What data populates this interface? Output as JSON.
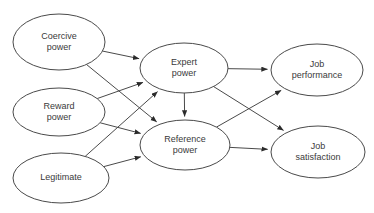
{
  "diagram": {
    "background_color": "#ffffff",
    "stroke_color": "#4a4a4a",
    "text_color": "#3a3a3a",
    "nodes": [
      {
        "id": "coercive",
        "lines": [
          "Coercive",
          "power"
        ],
        "cx": 59,
        "cy": 42,
        "rx": 46,
        "ry": 28
      },
      {
        "id": "reward",
        "lines": [
          "Reward",
          "power"
        ],
        "cx": 59,
        "cy": 112,
        "rx": 46,
        "ry": 24
      },
      {
        "id": "legitimate",
        "lines": [
          "Legitimate"
        ],
        "cx": 61,
        "cy": 178,
        "rx": 48,
        "ry": 25
      },
      {
        "id": "expert",
        "lines": [
          "Expert",
          "power"
        ],
        "cx": 184,
        "cy": 68,
        "rx": 44,
        "ry": 25
      },
      {
        "id": "reference",
        "lines": [
          "Reference",
          "power"
        ],
        "cx": 185,
        "cy": 145,
        "rx": 45,
        "ry": 25
      },
      {
        "id": "job_performance",
        "lines": [
          "Job",
          "performance"
        ],
        "cx": 317,
        "cy": 70,
        "rx": 46,
        "ry": 26
      },
      {
        "id": "job_satisfaction",
        "lines": [
          "Job",
          "satisfaction"
        ],
        "cx": 318,
        "cy": 152,
        "rx": 47,
        "ry": 26
      }
    ],
    "edges": [
      {
        "from": "coercive",
        "to": "expert",
        "label": ""
      },
      {
        "from": "coercive",
        "to": "reference",
        "label": ""
      },
      {
        "from": "reward",
        "to": "expert",
        "label": ""
      },
      {
        "from": "reward",
        "to": "reference",
        "label": ""
      },
      {
        "from": "legitimate",
        "to": "expert",
        "label": ""
      },
      {
        "from": "legitimate",
        "to": "reference",
        "label": ""
      },
      {
        "from": "expert",
        "to": "reference",
        "label": ""
      },
      {
        "from": "expert",
        "to": "job_performance",
        "label": ""
      },
      {
        "from": "expert",
        "to": "job_satisfaction",
        "label": ""
      },
      {
        "from": "reference",
        "to": "job_performance",
        "label": ""
      },
      {
        "from": "reference",
        "to": "job_satisfaction",
        "label": ""
      }
    ]
  }
}
